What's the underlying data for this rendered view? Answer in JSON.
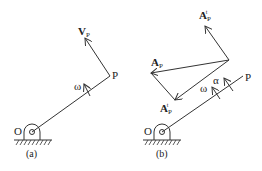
{
  "figure": {
    "panel_a": {
      "caption": "(a)",
      "labels": {
        "origin": "O",
        "point": "P",
        "angular_velocity": "ω",
        "velocity_main": "V",
        "velocity_sub": "P"
      }
    },
    "panel_b": {
      "caption": "(b)",
      "labels": {
        "origin": "O",
        "point": "P",
        "angular_velocity": "ω",
        "angular_acceleration": "α",
        "accel_total_main": "A",
        "accel_total_sub": "P",
        "accel_tangential_main": "A",
        "accel_tangential_sub": "P",
        "accel_tangential_sup": "t",
        "accel_normal_main": "A",
        "accel_normal_sub": "P",
        "accel_normal_sup": "t"
      }
    },
    "colors": {
      "stroke": "#333333",
      "text": "#222222"
    }
  }
}
